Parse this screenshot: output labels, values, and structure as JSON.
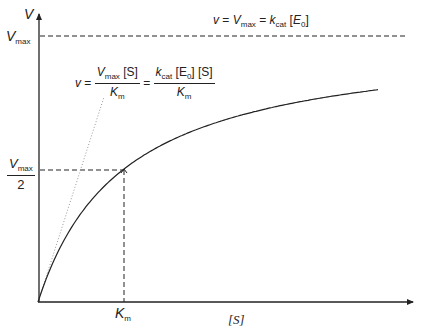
{
  "axes": {
    "y_label": "V",
    "x_label": "[S]",
    "vmax_label_main": "V",
    "vmax_label_sub": "max",
    "half_vmax_den": "2",
    "km_label_main": "K",
    "km_label_sub": "m"
  },
  "equations": {
    "asymptote": {
      "lhs": "v",
      "eq1": "=",
      "vmax_main": "V",
      "vmax_sub": "max",
      "eq2": "=",
      "kcat_main": "k",
      "kcat_sub": "cat",
      "e0_open": "[",
      "e0_main": "E",
      "e0_sub": "0",
      "e0_close": "]"
    },
    "initial_slope": {
      "lhs": "v",
      "eq1": "=",
      "num1_main": "V",
      "num1_sub": "max",
      "num1_rest": " [S]",
      "den1_main": "K",
      "den1_sub": "m",
      "eq2": "=",
      "num2_main": "k",
      "num2_sub": "cat",
      "num2_rest_a": " [E",
      "num2_rest_sub": "0",
      "num2_rest_b": "] [S]",
      "den2_main": "K",
      "den2_sub": "m"
    }
  },
  "colors": {
    "line": "#222222",
    "dotted": "#999999"
  },
  "chart_data": {
    "type": "line",
    "xlabel": "[S]",
    "ylabel": "V",
    "grid": false,
    "series": [
      {
        "name": "v = Vmax[S]/(Km+[S])",
        "style": "solid",
        "x": [
          0,
          0.25,
          0.5,
          1,
          1.5,
          2,
          2.5,
          3,
          3.5,
          3.97
        ],
        "y": [
          0,
          0.2,
          0.333,
          0.5,
          0.6,
          0.667,
          0.714,
          0.75,
          0.778,
          0.799
        ]
      },
      {
        "name": "initial slope Vmax[S]/Km",
        "style": "dotted",
        "x": [
          0,
          0.78
        ],
        "y": [
          0,
          0.78
        ]
      },
      {
        "name": "Vmax asymptote",
        "style": "dashed",
        "x": [
          0,
          4.3
        ],
        "y": [
          1,
          1
        ]
      }
    ],
    "annotations": [
      "Vmax",
      "Vmax/2",
      "Km",
      "v = Vmax = kcat [E0]",
      "v = Vmax[S]/Km = kcat[E0][S]/Km"
    ],
    "units": "x in units of Km, y in units of Vmax"
  }
}
